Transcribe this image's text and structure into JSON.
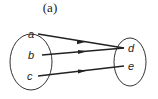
{
  "caption": "(a)",
  "domain_set": {
    "elements": [
      "a",
      "b",
      "c"
    ]
  },
  "codomain_set": {
    "elements": [
      "d",
      "e"
    ]
  },
  "mappings": [
    {
      "from": "a",
      "to": "d"
    },
    {
      "from": "b",
      "to": "d"
    },
    {
      "from": "c",
      "to": "e"
    }
  ],
  "colors": {
    "stroke": "#222222",
    "background": "#ffffff"
  }
}
